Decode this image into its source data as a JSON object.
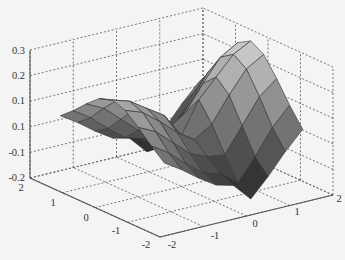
{
  "chart_data": {
    "type": "surface3d",
    "title": "",
    "xlabel": "",
    "ylabel": "",
    "zlabel": "",
    "x_ticks": [
      "-2",
      "-1",
      "0",
      "1",
      "2"
    ],
    "y_ticks": [
      "-2",
      "-1",
      "0",
      "1",
      "2"
    ],
    "z_ticks": [
      "-0.2",
      "-0.1",
      "0.1",
      "0.1",
      "0.2",
      "0.3"
    ],
    "xlim": [
      -2,
      2
    ],
    "ylim": [
      -2,
      2
    ],
    "zlim": [
      -0.2,
      0.3
    ],
    "grid": true,
    "colormap": "gray",
    "mesh_size": [
      9,
      9
    ]
  }
}
